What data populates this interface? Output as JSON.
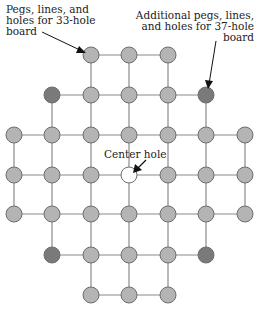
{
  "annotations": {
    "board33": [
      "Pegs, lines, and",
      "holes for 33-hole",
      "board"
    ],
    "board37": [
      "Additional pegs, lines,",
      "and holes for 37-hole",
      "board"
    ],
    "center": "Center hole"
  },
  "colors": {
    "peg": "#b4b4b4",
    "peg_extra": "#7a7a7a",
    "peg_stroke": "#6e6e6e",
    "line": "#8a8a8a",
    "hole": "#ffffff",
    "arrow": "#111111"
  },
  "grid": {
    "cols": 7,
    "rows": 7,
    "pegs": [
      [
        0,
        2,
        "peg"
      ],
      [
        0,
        3,
        "peg"
      ],
      [
        0,
        4,
        "peg"
      ],
      [
        1,
        1,
        "extra"
      ],
      [
        1,
        2,
        "peg"
      ],
      [
        1,
        3,
        "peg"
      ],
      [
        1,
        4,
        "peg"
      ],
      [
        1,
        5,
        "extra"
      ],
      [
        2,
        0,
        "peg"
      ],
      [
        2,
        1,
        "peg"
      ],
      [
        2,
        2,
        "peg"
      ],
      [
        2,
        3,
        "peg"
      ],
      [
        2,
        4,
        "peg"
      ],
      [
        2,
        5,
        "peg"
      ],
      [
        2,
        6,
        "peg"
      ],
      [
        3,
        0,
        "peg"
      ],
      [
        3,
        1,
        "peg"
      ],
      [
        3,
        2,
        "peg"
      ],
      [
        3,
        3,
        "hole"
      ],
      [
        3,
        4,
        "peg"
      ],
      [
        3,
        5,
        "peg"
      ],
      [
        3,
        6,
        "peg"
      ],
      [
        4,
        0,
        "peg"
      ],
      [
        4,
        1,
        "peg"
      ],
      [
        4,
        2,
        "peg"
      ],
      [
        4,
        3,
        "peg"
      ],
      [
        4,
        4,
        "peg"
      ],
      [
        4,
        5,
        "peg"
      ],
      [
        4,
        6,
        "peg"
      ],
      [
        5,
        1,
        "extra"
      ],
      [
        5,
        2,
        "peg"
      ],
      [
        5,
        3,
        "peg"
      ],
      [
        5,
        4,
        "peg"
      ],
      [
        5,
        5,
        "extra"
      ],
      [
        6,
        2,
        "peg"
      ],
      [
        6,
        3,
        "peg"
      ],
      [
        6,
        4,
        "peg"
      ]
    ]
  }
}
